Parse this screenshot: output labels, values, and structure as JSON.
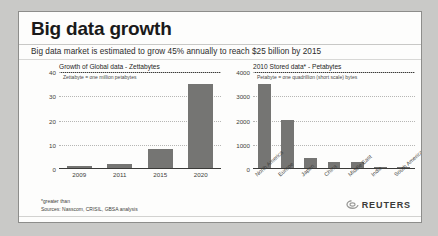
{
  "headline": "Big data growth",
  "subhead": "Big data market is estimated to grow 45% annually to reach $25 billion by 2015",
  "footnotes": {
    "star": "*greater than",
    "sources": "Sources: Nasscom, CRISIL, GBSA analysis"
  },
  "logo": {
    "word": "REUTERS",
    "mark_icon": "reuters-orbit-icon"
  },
  "colors": {
    "bar": "#757573",
    "axis": "#3a3a38",
    "grid": "#b6b6b4",
    "card_bg": "#fdfdfc",
    "page_bg": "#c9c9c7"
  },
  "chart_data": [
    {
      "type": "bar",
      "title": "Growth of Global data - Zettabytes",
      "subtitle": "Zettabyte = one million petabytes",
      "xlabel": "",
      "ylabel": "Zettabytes",
      "categories": [
        "2009",
        "2011",
        "2015",
        "2020"
      ],
      "values": [
        0.8,
        1.8,
        8,
        35
      ],
      "ylim": [
        0,
        40
      ],
      "yticks": [
        0,
        10,
        20,
        30,
        40
      ],
      "ytick_labels": [
        "0",
        "10",
        "20",
        "30",
        "40"
      ],
      "grid": true,
      "legend": "none"
    },
    {
      "type": "bar",
      "title": "2010 Stored data* - Petabytes",
      "subtitle": "Petabyte = one quadrillion (short scale) bytes",
      "xlabel": "",
      "ylabel": "Petabytes",
      "categories": [
        "North America",
        "Europe",
        "Japan",
        "China",
        "Middle East",
        "India",
        "South America"
      ],
      "values": [
        3500,
        2000,
        400,
        250,
        250,
        50,
        50
      ],
      "ylim": [
        0,
        4000
      ],
      "yticks": [
        0,
        1000,
        2000,
        3000,
        4000
      ],
      "ytick_labels": [
        "0",
        "1000",
        "2000",
        "3000",
        "4000"
      ],
      "grid": true,
      "legend": "none"
    }
  ]
}
